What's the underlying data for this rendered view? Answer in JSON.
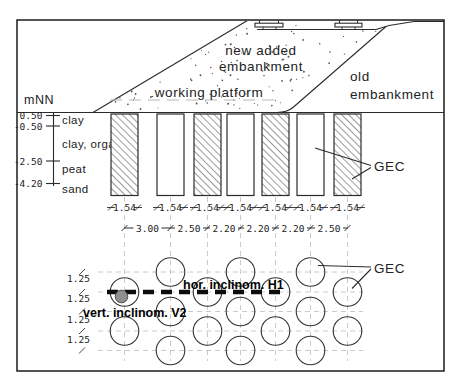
{
  "section": {
    "new_embankment_label": [
      "new added",
      "embankment"
    ],
    "working_platform_label": "working platform",
    "old_embankment_label": [
      "old",
      "embankment"
    ],
    "gec_label": "GEC",
    "axis": {
      "unit": "mNN",
      "levels": [
        "0.50",
        "-0.50",
        "-2.50",
        "-4.20"
      ],
      "soil_layers": [
        "clay",
        "clay, organic",
        "peat",
        "sand"
      ]
    },
    "column_width_labels": [
      "1.54",
      "1.54",
      "1.54",
      "1.54",
      "1.54",
      "1.54",
      "1.54"
    ],
    "column_spacing_labels": [
      "3.00",
      "2.50",
      "2.20",
      "2.20",
      "2.20",
      "2.50"
    ]
  },
  "plan": {
    "gec_label": "GEC",
    "row_spacing_labels": [
      "1.25",
      "1.25",
      "1.25",
      "1.25"
    ],
    "horizontal_inclinometer_label": "hor. inclinom. H1",
    "vertical_inclinometer_label": "vert. inclinom. V2"
  },
  "colors": {
    "line": "#2b2b2b",
    "faint": "#bdbdbd",
    "inclinometer_dot": "#8f8f8f"
  }
}
